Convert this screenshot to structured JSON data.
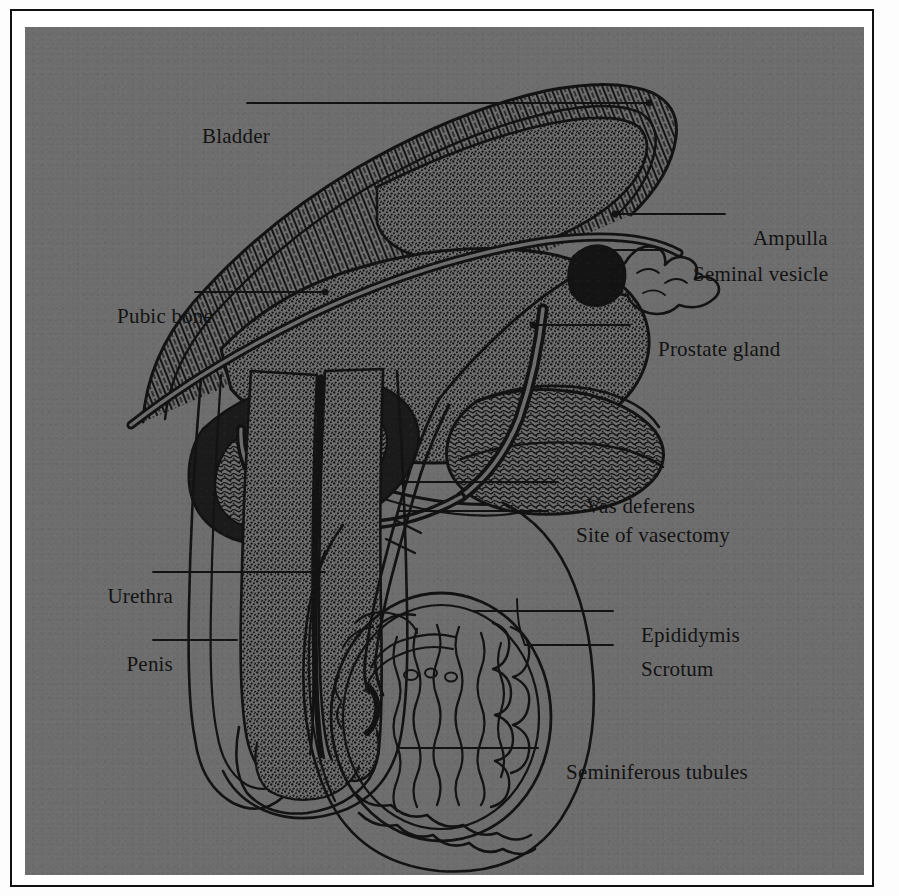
{
  "figure": {
    "background_color": "#6e6e6e",
    "ink_color": "#131313",
    "frame_color": "#111111",
    "paper_color": "#ffffff"
  },
  "labels": {
    "bladder": "Bladder",
    "pubic_bone": "Pubic bone",
    "urethra": "Urethra",
    "penis": "Penis",
    "ampulla": "Ampulla",
    "seminal_vesicle": "Seminal vesicle",
    "prostate_gland": "Prostate gland",
    "vas_deferens": "Vas deferens",
    "site_of_vasectomy": "Site of vasectomy",
    "epididymis": "Epididymis",
    "scrotum": "Scrotum",
    "seminiferous_tubules": "Seminiferous tubules"
  },
  "label_layout": [
    {
      "key": "bladder",
      "side": "left",
      "x": 245,
      "y": 112
    },
    {
      "key": "pubic_bone",
      "side": "left",
      "x": 188,
      "y": 292
    },
    {
      "key": "urethra",
      "side": "left",
      "x": 148,
      "y": 572
    },
    {
      "key": "penis",
      "side": "left",
      "x": 148,
      "y": 640
    },
    {
      "key": "ampulla",
      "side": "right",
      "x": 728,
      "y": 214
    },
    {
      "key": "seminal_vesicle",
      "side": "right",
      "x": 668,
      "y": 250
    },
    {
      "key": "prostate_gland",
      "side": "right",
      "x": 633,
      "y": 325
    },
    {
      "key": "vas_deferens",
      "side": "right",
      "x": 561,
      "y": 482
    },
    {
      "key": "site_of_vasectomy",
      "side": "right",
      "x": 551,
      "y": 511
    },
    {
      "key": "epididymis",
      "side": "right",
      "x": 616,
      "y": 611
    },
    {
      "key": "scrotum",
      "side": "right",
      "x": 616,
      "y": 645
    },
    {
      "key": "seminiferous_tubules",
      "side": "right",
      "x": 541,
      "y": 748
    }
  ],
  "structures": [
    "bladder",
    "pubic bone",
    "urethra",
    "penis",
    "ampulla",
    "seminal vesicle",
    "prostate gland",
    "vas deferens",
    "site of vasectomy",
    "epididymis",
    "scrotum",
    "seminiferous tubules"
  ]
}
